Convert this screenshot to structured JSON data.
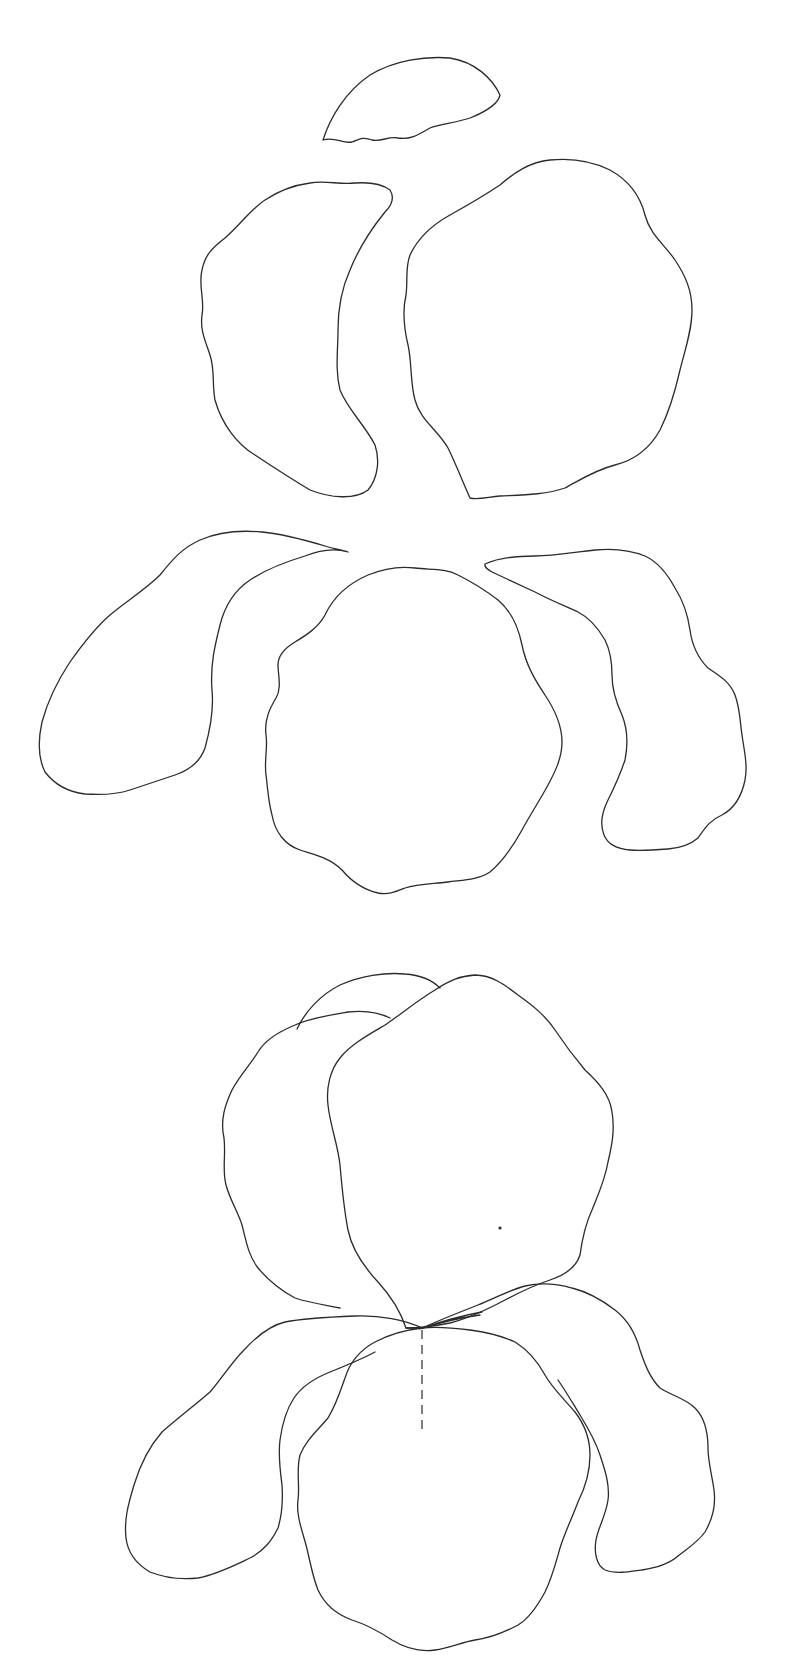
{
  "diagram": {
    "background": "#ffffff",
    "line_color": "#2b2b2b",
    "sections": [
      {
        "name": "separated-petals",
        "pieces": [
          "top-crest-petal",
          "left-standard-petal",
          "right-standard-petal",
          "left-fall-petal",
          "center-fall-petal",
          "right-fall-petal"
        ]
      },
      {
        "name": "assembled-iris",
        "pieces": [
          "back-crest-petal",
          "left-standard-petal",
          "right-standard-petal",
          "left-fall-petal",
          "center-fall-petal",
          "right-fall-petal"
        ],
        "markers": [
          "center-dashed-guide-line",
          "placement-dot"
        ]
      }
    ]
  }
}
